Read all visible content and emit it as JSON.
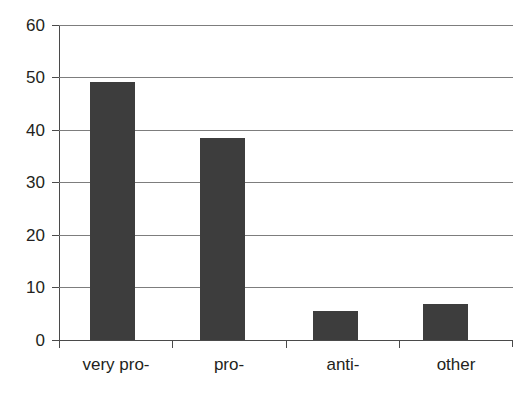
{
  "figure": {
    "clipped_top_text": "",
    "background_color": "#ffffff"
  },
  "chart_data": {
    "type": "bar",
    "title": "",
    "subtitle": "",
    "xlabel": "",
    "ylabel": "",
    "categories": [
      "very pro-",
      "pro-",
      "anti-",
      "other"
    ],
    "values": [
      49.2,
      38.5,
      5.5,
      6.8
    ],
    "series": [
      {
        "name": "",
        "values": [
          49.2,
          38.5,
          5.5,
          6.8
        ],
        "color": "#3d3d3d"
      }
    ],
    "ylim": [
      0,
      60
    ],
    "yticks": [
      0,
      10,
      20,
      30,
      40,
      50,
      60
    ],
    "ytick_labels": [
      "0",
      "10",
      "20",
      "30",
      "40",
      "50",
      "60"
    ],
    "grid": true,
    "grid_axis": "y",
    "grid_color": "#7d7d7d",
    "legend": false,
    "legend_position": "none",
    "axis_color": "#4a4a4a",
    "bar_color": "#3d3d3d",
    "data_labels": false
  }
}
